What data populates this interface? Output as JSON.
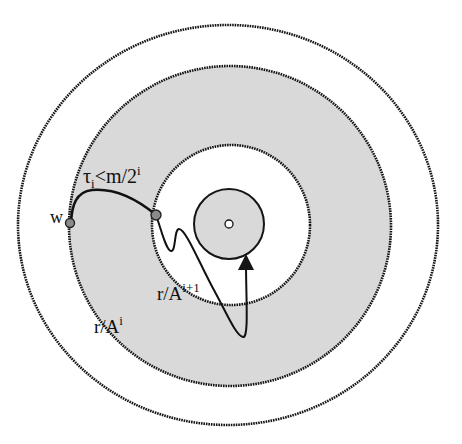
{
  "diagram": {
    "type": "concentric-annuli",
    "colors": {
      "background": "#ffffff",
      "shaded": "#d9d9d9",
      "stroke": "#151515",
      "node_fill": "#8a8a8a"
    },
    "circles": [
      {
        "name": "outer-circle",
        "cx": 228,
        "cy": 225,
        "rx": 210,
        "ry": 200,
        "fill": "#ffffff",
        "dashed": true
      },
      {
        "name": "shaded-annulus-outer",
        "cx": 230,
        "cy": 226,
        "rx": 161,
        "ry": 160,
        "fill": "#d9d9d9",
        "dashed": true
      },
      {
        "name": "inner-white-circle",
        "cx": 231,
        "cy": 225,
        "rx": 79,
        "ry": 80,
        "fill": "#ffffff",
        "dashed": true
      },
      {
        "name": "center-shaded-disc",
        "cx": 229,
        "cy": 224,
        "rx": 35,
        "ry": 35,
        "fill": "#d9d9d9",
        "dashed": false
      },
      {
        "name": "center-point",
        "cx": 229,
        "cy": 224,
        "rx": 4,
        "ry": 4,
        "fill": "#ffffff",
        "dashed": false
      }
    ],
    "nodes": [
      {
        "name": "node-w",
        "x": 70,
        "y": 223,
        "label": "w"
      },
      {
        "name": "node-inner",
        "x": 156,
        "y": 215
      }
    ],
    "labels": {
      "w": "w",
      "tau": "τ",
      "tau_sub": "i",
      "tau_rest": "<m/2",
      "tau_sup": "i",
      "r_outer_base": "r/A",
      "r_outer_sup": "i",
      "r_inner_base": "r/A",
      "r_inner_sup": "i+1"
    }
  }
}
